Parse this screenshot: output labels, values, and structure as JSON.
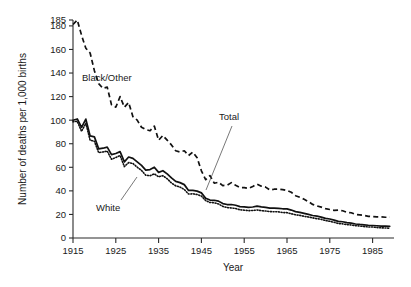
{
  "chart_data": {
    "type": "line",
    "title": "",
    "xlabel": "Year",
    "ylabel": "Number of deaths per 1,000 births",
    "xlim": [
      1915,
      1990
    ],
    "ylim": [
      0,
      185
    ],
    "grid": false,
    "legend_position": "inline-annotations",
    "xticks": [
      1915,
      1925,
      1935,
      1945,
      1955,
      1965,
      1975,
      1985
    ],
    "xtick_labels": [
      "1915",
      "1925",
      "1935",
      "1945",
      "1955",
      "1965",
      "1975",
      "1985"
    ],
    "yticks": [
      0,
      20,
      40,
      60,
      80,
      100,
      120,
      140,
      160,
      180,
      185
    ],
    "ytick_labels": [
      "0",
      "20",
      "40",
      "60",
      "80",
      "100",
      "120",
      "140",
      "160",
      "180",
      "185"
    ],
    "annotations": [
      {
        "text": "Black/Other",
        "series": "Black/Other",
        "x": 1922,
        "y": 150
      },
      {
        "text": "Total",
        "series": "Total",
        "x": 1948,
        "y": 86
      },
      {
        "text": "White",
        "series": "White",
        "x": 1928,
        "y": 26
      }
    ],
    "x": [
      1915,
      1916,
      1917,
      1918,
      1919,
      1920,
      1921,
      1922,
      1923,
      1924,
      1925,
      1926,
      1927,
      1928,
      1929,
      1930,
      1931,
      1932,
      1933,
      1934,
      1935,
      1936,
      1937,
      1938,
      1939,
      1940,
      1941,
      1942,
      1943,
      1944,
      1945,
      1946,
      1947,
      1948,
      1949,
      1950,
      1951,
      1952,
      1953,
      1954,
      1955,
      1956,
      1957,
      1958,
      1959,
      1960,
      1961,
      1962,
      1963,
      1964,
      1965,
      1966,
      1967,
      1968,
      1969,
      1970,
      1971,
      1972,
      1973,
      1974,
      1975,
      1976,
      1977,
      1978,
      1979,
      1980,
      1981,
      1982,
      1983,
      1984,
      1985,
      1986,
      1987,
      1988,
      1989
    ],
    "series": [
      {
        "name": "Black/Other",
        "style": "dashed",
        "values": [
          181.2,
          185.0,
          172.0,
          161.0,
          157.0,
          142.0,
          131.0,
          127.0,
          128.0,
          113.0,
          111.0,
          120.0,
          111.0,
          115.0,
          103.0,
          100.0,
          94.0,
          92.0,
          91.0,
          95.0,
          83.0,
          87.0,
          83.0,
          79.0,
          74.0,
          73.0,
          74.0,
          70.0,
          73.0,
          68.0,
          57.0,
          49.5,
          53.0,
          46.5,
          47.3,
          44.5,
          44.8,
          47.0,
          44.7,
          42.8,
          42.8,
          42.1,
          43.7,
          45.7,
          44.0,
          43.2,
          40.7,
          41.4,
          41.5,
          41.1,
          40.3,
          38.8,
          35.9,
          34.5,
          32.9,
          30.9,
          28.5,
          27.2,
          26.2,
          24.9,
          24.2,
          23.5,
          23.6,
          23.1,
          21.8,
          21.4,
          20.0,
          19.6,
          19.2,
          18.4,
          18.2,
          18.0,
          17.9,
          17.6,
          17.7
        ]
      },
      {
        "name": "Total",
        "style": "solid",
        "values": [
          99.9,
          101.0,
          93.8,
          100.9,
          86.6,
          85.8,
          75.6,
          76.2,
          77.1,
          70.8,
          71.7,
          73.3,
          64.6,
          68.7,
          67.6,
          64.6,
          61.6,
          57.6,
          58.1,
          60.1,
          55.7,
          57.1,
          54.4,
          51.0,
          48.0,
          47.0,
          45.3,
          40.4,
          40.4,
          39.8,
          38.3,
          33.8,
          32.2,
          32.0,
          31.3,
          29.2,
          28.4,
          28.4,
          27.8,
          26.6,
          26.4,
          26.0,
          26.3,
          27.1,
          26.4,
          26.0,
          25.3,
          25.3,
          25.2,
          24.8,
          24.7,
          23.7,
          22.4,
          21.8,
          20.9,
          20.0,
          19.1,
          18.5,
          17.7,
          16.7,
          16.1,
          15.2,
          14.1,
          13.8,
          13.1,
          12.6,
          11.9,
          11.5,
          11.2,
          10.8,
          10.6,
          10.4,
          10.1,
          10.0,
          9.8
        ]
      },
      {
        "name": "White",
        "style": "dotted",
        "values": [
          98.6,
          99.0,
          90.5,
          97.4,
          83.0,
          82.1,
          72.5,
          73.0,
          73.7,
          66.8,
          68.3,
          70.0,
          60.6,
          64.0,
          63.2,
          60.1,
          57.4,
          53.3,
          52.8,
          54.5,
          51.9,
          52.9,
          50.3,
          46.7,
          44.3,
          43.2,
          41.2,
          37.3,
          37.5,
          36.9,
          35.6,
          31.8,
          30.1,
          29.9,
          28.9,
          26.8,
          25.8,
          25.5,
          25.0,
          23.9,
          23.6,
          23.2,
          23.3,
          23.8,
          23.2,
          22.9,
          22.4,
          22.3,
          22.2,
          21.6,
          21.5,
          20.6,
          19.7,
          19.2,
          18.4,
          17.8,
          17.1,
          16.4,
          15.8,
          14.8,
          14.2,
          13.3,
          12.3,
          12.0,
          11.4,
          11.0,
          10.5,
          10.1,
          9.7,
          9.4,
          9.3,
          8.9,
          8.6,
          8.5,
          8.2
        ]
      }
    ]
  }
}
